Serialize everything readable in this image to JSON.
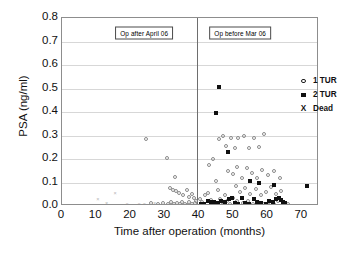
{
  "chart_data": {
    "type": "scatter",
    "title": "",
    "xlabel": "Time after operation (months)",
    "ylabel": "PSA (ng/ml)",
    "xlim": [
      0,
      75
    ],
    "ylim": [
      0.0,
      0.8
    ],
    "xticks": [
      "0",
      "10",
      "20",
      "30",
      "40",
      "50",
      "60",
      "70"
    ],
    "xtick_values": [
      0,
      10,
      20,
      30,
      40,
      50,
      60,
      70
    ],
    "yticks": [
      "0.8",
      "0.7",
      "0.6",
      "0.5",
      "0.4",
      "0.3",
      "0.2",
      "0.1",
      "0.0"
    ],
    "ytick_values": [
      0.8,
      0.7,
      0.6,
      0.5,
      0.4,
      0.3,
      0.2,
      0.1,
      0.0
    ],
    "grid": "horizontal",
    "legend_position": "right",
    "legend": [
      {
        "marker": "open-circle",
        "label": "1 TUR"
      },
      {
        "marker": "filled-square",
        "label": "2 TUR"
      },
      {
        "marker": "cross",
        "label": "Dead"
      }
    ],
    "annotations": [
      {
        "text": "Op after April 06",
        "x": 24,
        "y": 0.735
      },
      {
        "text": "Op before Mar 06",
        "x": 52,
        "y": 0.735
      }
    ],
    "divider": {
      "x": 39.5,
      "orientation": "vertical"
    },
    "series": [
      {
        "name": "1 TUR",
        "marker": "open-circle",
        "points": [
          [
            24.5,
            0.285
          ],
          [
            30.5,
            0.205
          ],
          [
            33.0,
            0.125
          ],
          [
            31.5,
            0.075
          ],
          [
            32.3,
            0.068
          ],
          [
            33.2,
            0.062
          ],
          [
            34.0,
            0.055
          ],
          [
            35.2,
            0.048
          ],
          [
            36.4,
            0.07
          ],
          [
            37.0,
            0.04
          ],
          [
            37.8,
            0.052
          ],
          [
            38.6,
            0.035
          ],
          [
            26.0,
            0.012
          ],
          [
            28.0,
            0.01
          ],
          [
            29.5,
            0.014
          ],
          [
            30.8,
            0.009
          ],
          [
            31.8,
            0.016
          ],
          [
            32.6,
            0.008
          ],
          [
            33.5,
            0.013
          ],
          [
            34.4,
            0.007
          ],
          [
            35.0,
            0.018
          ],
          [
            35.8,
            0.01
          ],
          [
            36.5,
            0.006
          ],
          [
            37.2,
            0.015
          ],
          [
            38.0,
            0.009
          ],
          [
            38.8,
            0.012
          ],
          [
            39.2,
            0.02
          ],
          [
            40.2,
            0.03
          ],
          [
            41.0,
            0.018
          ],
          [
            41.8,
            0.046
          ],
          [
            42.6,
            0.055
          ],
          [
            43.4,
            0.026
          ],
          [
            44.2,
            0.013
          ],
          [
            45.0,
            0.105
          ],
          [
            45.6,
            0.068
          ],
          [
            46.2,
            0.03
          ],
          [
            46.8,
            0.015
          ],
          [
            47.5,
            0.048
          ],
          [
            48.2,
            0.022
          ],
          [
            49.0,
            0.01
          ],
          [
            49.8,
            0.035
          ],
          [
            43.0,
            0.175
          ],
          [
            44.0,
            0.2
          ],
          [
            45.8,
            0.285
          ],
          [
            47.0,
            0.3
          ],
          [
            48.0,
            0.255
          ],
          [
            49.2,
            0.29
          ],
          [
            50.5,
            0.245
          ],
          [
            51.5,
            0.29
          ],
          [
            53.0,
            0.3
          ],
          [
            54.5,
            0.245
          ],
          [
            56.0,
            0.29
          ],
          [
            57.5,
            0.25
          ],
          [
            59.0,
            0.305
          ],
          [
            48.5,
            0.15
          ],
          [
            50.0,
            0.135
          ],
          [
            51.0,
            0.165
          ],
          [
            52.5,
            0.12
          ],
          [
            54.0,
            0.16
          ],
          [
            55.5,
            0.14
          ],
          [
            57.0,
            0.12
          ],
          [
            58.5,
            0.155
          ],
          [
            60.0,
            0.13
          ],
          [
            62.0,
            0.15
          ],
          [
            63.5,
            0.12
          ],
          [
            50.8,
            0.085
          ],
          [
            52.0,
            0.06
          ],
          [
            53.5,
            0.075
          ],
          [
            55.0,
            0.05
          ],
          [
            56.5,
            0.072
          ],
          [
            58.0,
            0.045
          ],
          [
            59.5,
            0.06
          ],
          [
            61.0,
            0.08
          ],
          [
            62.5,
            0.05
          ],
          [
            64.0,
            0.065
          ],
          [
            51.2,
            0.02
          ],
          [
            52.8,
            0.012
          ],
          [
            54.2,
            0.022
          ],
          [
            55.8,
            0.01
          ],
          [
            57.2,
            0.018
          ],
          [
            58.8,
            0.008
          ],
          [
            60.5,
            0.015
          ],
          [
            61.8,
            0.01
          ],
          [
            63.0,
            0.02
          ],
          [
            64.5,
            0.012
          ],
          [
            66.0,
            0.01
          ]
        ]
      },
      {
        "name": "2 TUR",
        "marker": "filled-square",
        "points": [
          [
            45.8,
            0.505
          ],
          [
            44.8,
            0.395
          ],
          [
            48.5,
            0.23
          ],
          [
            55.0,
            0.105
          ],
          [
            57.5,
            0.1
          ],
          [
            61.8,
            0.09
          ],
          [
            71.5,
            0.085
          ],
          [
            42.5,
            0.02
          ],
          [
            43.5,
            0.018
          ],
          [
            44.5,
            0.015
          ],
          [
            45.5,
            0.012
          ],
          [
            46.5,
            0.02
          ],
          [
            47.5,
            0.016
          ],
          [
            48.8,
            0.03
          ],
          [
            49.5,
            0.032
          ],
          [
            50.5,
            0.012
          ],
          [
            51.5,
            0.01
          ],
          [
            52.5,
            0.035
          ],
          [
            53.5,
            0.014
          ],
          [
            54.5,
            0.01
          ],
          [
            56.0,
            0.028
          ],
          [
            57.0,
            0.018
          ],
          [
            58.2,
            0.012
          ],
          [
            59.5,
            0.01
          ],
          [
            60.5,
            0.022
          ],
          [
            61.5,
            0.015
          ],
          [
            62.5,
            0.03
          ],
          [
            63.2,
            0.035
          ],
          [
            63.8,
            0.025
          ],
          [
            64.5,
            0.018
          ],
          [
            65.2,
            0.012
          ],
          [
            40.5,
            0.01
          ],
          [
            41.5,
            0.008
          ]
        ]
      },
      {
        "name": "Dead",
        "marker": "cross",
        "points": [
          [
            10.5,
            0.03
          ],
          [
            13.0,
            0.012
          ],
          [
            15.5,
            0.055
          ],
          [
            19.0,
            0.01
          ],
          [
            22.5,
            0.009
          ],
          [
            24.0,
            0.008
          ],
          [
            27.0,
            0.011
          ]
        ]
      }
    ]
  }
}
